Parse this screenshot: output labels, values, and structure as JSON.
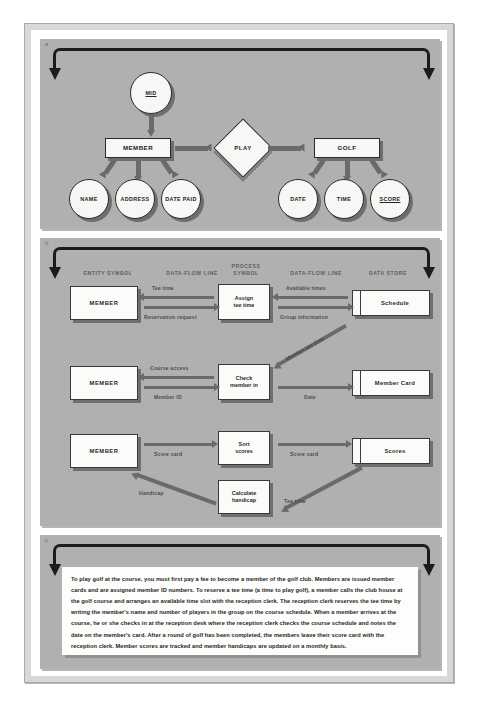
{
  "figure": {
    "panels": [
      {
        "letter": "a",
        "kind": "entity-relationship-diagram"
      },
      {
        "letter": "b",
        "kind": "data-flow-diagram"
      },
      {
        "letter": "c",
        "kind": "narrative-description"
      }
    ]
  },
  "erd": {
    "entities": [
      {
        "id": "member",
        "label": "MEMBER"
      },
      {
        "id": "golf",
        "label": "GOLF"
      }
    ],
    "relationship": {
      "id": "play",
      "label": "PLAY"
    },
    "member_key": {
      "label": "MID"
    },
    "member_attributes": [
      {
        "label": "NAME"
      },
      {
        "label": "ADDRESS"
      },
      {
        "label": "DATE PAID"
      }
    ],
    "golf_attributes": [
      {
        "label": "DATE"
      },
      {
        "label": "TIME"
      },
      {
        "label": "SCORE"
      }
    ]
  },
  "dfd": {
    "headers": [
      {
        "label": "ENTITY SYMBOL"
      },
      {
        "label": "DATA-FLOW LINE"
      },
      {
        "label": "PROCESS\nSYMBOL"
      },
      {
        "label": "DATA-FLOW LINE"
      },
      {
        "label": "DATA STORE"
      }
    ],
    "entities": [
      {
        "label": "MEMBER"
      },
      {
        "label": "MEMBER"
      },
      {
        "label": "MEMBER"
      }
    ],
    "processes": [
      {
        "label": "Assign\ntee time"
      },
      {
        "label": "Check\nmember in"
      },
      {
        "label": "Sort\nscores"
      },
      {
        "label": "Calculate\nhandicap"
      }
    ],
    "stores": [
      {
        "label": "Schedule"
      },
      {
        "label": "Member Card"
      },
      {
        "label": "Scores"
      }
    ],
    "flows": [
      {
        "label": "Tee time"
      },
      {
        "label": "Reservation request"
      },
      {
        "label": "Available times"
      },
      {
        "label": "Group information"
      },
      {
        "label": "Course access"
      },
      {
        "label": "Member ID"
      },
      {
        "label": "Member tee time"
      },
      {
        "label": "Date"
      },
      {
        "label": "Score card"
      },
      {
        "label": "Score card"
      },
      {
        "label": "Handicap"
      },
      {
        "label": "Tee time"
      }
    ]
  },
  "narrative": {
    "text": "To play golf at the course, you must first pay a fee to become a member of the golf club. Members are issued member cards and are assigned member ID numbers. To reserve a tee time (a time to play golf), a member calls the club house at the golf course and arranges an available time slot with the reception clerk. The reception clerk reserves the tee time by writing the member's name and number of players in the group on the course schedule. When a member arrives at the course, he or she checks in at the reception desk where the reception clerk checks the course schedule and notes the date on the member's card. After a round of golf has been completed, the members leave their score card with the reception clerk. Member scores are tracked and member handicaps are updated on a monthly basis."
  },
  "colors": {
    "panel_bg": "#b0b0b0",
    "node_fill": "#f7f7f5",
    "arrow_grey": "#6a6a6a",
    "bracket_black": "#1c1c1c",
    "frame_grey": "#d8d8d8"
  }
}
